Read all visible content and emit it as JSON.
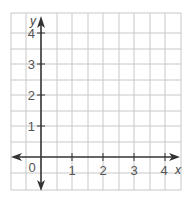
{
  "diagram": {
    "type": "coordinate-grid",
    "axis_labels": {
      "x": "x",
      "y": "y"
    },
    "origin_label": "0",
    "x_ticks": [
      "1",
      "2",
      "3",
      "4"
    ],
    "y_ticks": [
      "1",
      "2",
      "3",
      "4"
    ],
    "colors": {
      "grid": "#c8c8c8",
      "axis": "#333333",
      "label": "#555555"
    }
  }
}
